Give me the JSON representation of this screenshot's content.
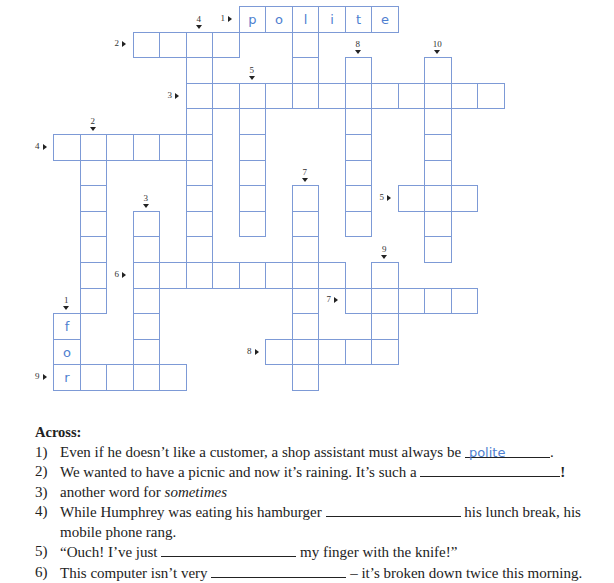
{
  "puzzle": {
    "grid_color": "#7d9ad6",
    "answer_color": "#4f7fd0",
    "origin": {
      "x": 53,
      "y": 6
    },
    "cell": {
      "w": 26.5,
      "h": 25.6
    },
    "words": [
      {
        "id": "across-1",
        "dir": "across",
        "label": "1",
        "row": 0,
        "col": 7,
        "len": 6,
        "letters": [
          "p",
          "o",
          "l",
          "i",
          "t",
          "e"
        ]
      },
      {
        "id": "across-2",
        "dir": "across",
        "label": "2",
        "row": 1,
        "col": 3,
        "len": 4,
        "letters": []
      },
      {
        "id": "across-3",
        "dir": "across",
        "label": "3",
        "row": 3,
        "col": 5,
        "len": 12,
        "letters": []
      },
      {
        "id": "across-4",
        "dir": "across",
        "label": "4",
        "row": 5,
        "col": 0,
        "len": 6,
        "letters": []
      },
      {
        "id": "across-5",
        "dir": "across",
        "label": "5",
        "row": 7,
        "col": 13,
        "len": 3,
        "letters": []
      },
      {
        "id": "across-6",
        "dir": "across",
        "label": "6",
        "row": 10,
        "col": 3,
        "len": 8,
        "letters": []
      },
      {
        "id": "across-7",
        "dir": "across",
        "label": "7",
        "row": 11,
        "col": 11,
        "len": 5,
        "letters": []
      },
      {
        "id": "across-8",
        "dir": "across",
        "label": "8",
        "row": 13,
        "col": 8,
        "len": 5,
        "letters": []
      },
      {
        "id": "across-9",
        "dir": "across",
        "label": "9",
        "row": 14,
        "col": 0,
        "len": 5,
        "letters": [
          "r"
        ]
      },
      {
        "id": "down-1",
        "dir": "down",
        "label": "1",
        "row": 12,
        "col": 0,
        "len": 3,
        "letters": [
          "f",
          "o",
          "r"
        ]
      },
      {
        "id": "down-2",
        "dir": "down",
        "label": "2",
        "row": 5,
        "col": 1,
        "len": 7,
        "letters": []
      },
      {
        "id": "down-3",
        "dir": "down",
        "label": "3",
        "row": 8,
        "col": 3,
        "len": 7,
        "letters": []
      },
      {
        "id": "down-4",
        "dir": "down",
        "label": "4",
        "row": 1,
        "col": 5,
        "len": 10,
        "letters": []
      },
      {
        "id": "down-5",
        "dir": "down",
        "label": "5",
        "row": 3,
        "col": 7,
        "len": 6,
        "letters": []
      },
      {
        "id": "down-6",
        "dir": "down",
        "label": "",
        "row": 0,
        "col": 9,
        "len": 4,
        "letters": []
      },
      {
        "id": "down-7",
        "dir": "down",
        "label": "7",
        "row": 7,
        "col": 9,
        "len": 8,
        "letters": []
      },
      {
        "id": "down-8",
        "dir": "down",
        "label": "8",
        "row": 2,
        "col": 11,
        "len": 7,
        "letters": []
      },
      {
        "id": "down-9",
        "dir": "down",
        "label": "9",
        "row": 10,
        "col": 12,
        "len": 4,
        "letters": []
      },
      {
        "id": "down-10",
        "dir": "down",
        "label": "10",
        "row": 2,
        "col": 14,
        "len": 8,
        "letters": []
      }
    ]
  },
  "clues": {
    "heading": "Across:",
    "items": [
      {
        "num": "1)",
        "before": "Even if he doesn’t like a customer, a shop assistant must always be",
        "answer": "polite",
        "after": ".",
        "blank_w": 85
      },
      {
        "num": "2)",
        "before": "We wanted to have a picnic and now it’s raining. It’s such a",
        "answer": "",
        "after": "!",
        "blank_w": 140
      },
      {
        "num": "3)",
        "before": "another word for",
        "italic": "sometimes",
        "answer": null,
        "after": ""
      },
      {
        "num": "4)",
        "before": "While Humphrey was eating his hamburger",
        "answer": "",
        "after": "his lunch break, his mobile phone rang.",
        "blank_w": 135
      },
      {
        "num": "5)",
        "before": "“Ouch! I’ve just",
        "answer": "",
        "after": "my finger with the knife!”",
        "blank_w": 135
      },
      {
        "num": "6)",
        "before": "This computer isn’t very",
        "answer": "",
        "after": "– it’s broken down twice this morning.",
        "blank_w": 135
      }
    ]
  }
}
